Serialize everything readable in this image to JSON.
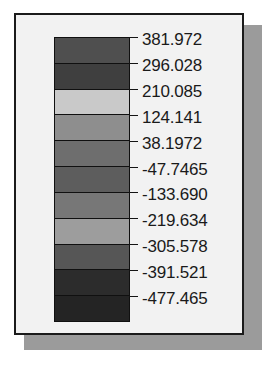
{
  "panel": {
    "background_color": "#f2f2f2",
    "border_color": "#1b1b1b",
    "shadow_color": "#9b9b9b"
  },
  "colorbar": {
    "orientation": "vertical",
    "band_count": 11,
    "outline_color": "#101010",
    "bands": [
      {
        "index": 1,
        "color": "#4f4f4f",
        "range_top": "381.972",
        "range_bottom": "296.028"
      },
      {
        "index": 2,
        "color": "#3f3f3f",
        "range_top": "296.028",
        "range_bottom": "210.085"
      },
      {
        "index": 3,
        "color": "#c9c9c9",
        "range_top": "210.085",
        "range_bottom": "124.141"
      },
      {
        "index": 4,
        "color": "#8e8e8e",
        "range_top": "124.141",
        "range_bottom": "38.1972"
      },
      {
        "index": 5,
        "color": "#6e6e6e",
        "range_top": "38.1972",
        "range_bottom": "-47.7465"
      },
      {
        "index": 6,
        "color": "#5d5d5d",
        "range_top": "-47.7465",
        "range_bottom": "-133.690"
      },
      {
        "index": 7,
        "color": "#777777",
        "range_top": "-133.690",
        "range_bottom": "-219.634"
      },
      {
        "index": 8,
        "color": "#9d9d9d",
        "range_top": "-219.634",
        "range_bottom": "-305.578"
      },
      {
        "index": 9,
        "color": "#565656",
        "range_top": "-305.578",
        "range_bottom": "-391.521"
      },
      {
        "index": 10,
        "color": "#2c2c2c",
        "range_top": "-391.521",
        "range_bottom": "-477.465"
      },
      {
        "index": 11,
        "color": "#242424",
        "range_top": "-477.465",
        "range_bottom": "-477.465"
      }
    ]
  },
  "chart_data": {
    "type": "colorbar",
    "title": "",
    "xlabel": "",
    "ylabel": "",
    "orientation": "vertical",
    "grid": false,
    "legend_position": "none",
    "scale_direction": "descending",
    "tick_count": 12,
    "tick_labels": [
      "381.972",
      "296.028",
      "210.085",
      "124.141",
      "38.1972",
      "-47.7465",
      "-133.690",
      "-219.634",
      "-305.578",
      "-391.521",
      "-477.465"
    ],
    "tick_values": [
      381.972,
      296.028,
      210.085,
      124.141,
      38.1972,
      -47.7465,
      -133.69,
      -219.634,
      -305.578,
      -391.521,
      -477.465
    ],
    "value_range": [
      -477.465,
      381.972
    ],
    "interval": 85.944,
    "band_colors": [
      "#4f4f4f",
      "#3f3f3f",
      "#c9c9c9",
      "#8e8e8e",
      "#6e6e6e",
      "#5d5d5d",
      "#777777",
      "#9d9d9d",
      "#565656",
      "#2c2c2c",
      "#242424"
    ],
    "text_color": "#1a1a1a"
  }
}
